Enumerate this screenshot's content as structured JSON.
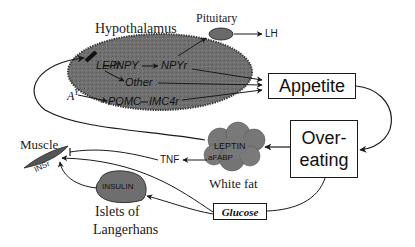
{
  "diagram": {
    "hypothalamus": {
      "label": "Hypothalamus",
      "nodes": {
        "lepr": "LEPr",
        "inpy": "INPY",
        "npyr": "NPYr",
        "other": "Other",
        "ay": "A",
        "ay_sup": "Y",
        "pomc": "POMC",
        "imc4r": "IMC4r"
      }
    },
    "pituitary": {
      "label": "Pituitary",
      "output": "LH"
    },
    "appetite": {
      "label": "Appetite"
    },
    "overeating": {
      "line1": "Over-",
      "line2": "eating"
    },
    "white_fat": {
      "label": "White fat",
      "leptin": "LEPTIN",
      "afabp": "aFABP"
    },
    "tnf": {
      "label": "TNF"
    },
    "muscle": {
      "label": "Muscle",
      "receptor": "INSr"
    },
    "islets": {
      "line1": "Islets of",
      "line2": "Langerhans",
      "insulin": "INSULIN"
    },
    "glucose": {
      "label": "Glucose"
    },
    "colors": {
      "ellipse_fill": "#6e6e6e",
      "ellipse_edge": "#3a3a3a",
      "line": "#1a1a1a",
      "blob_fill": "#7a7a7a"
    }
  }
}
